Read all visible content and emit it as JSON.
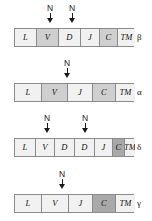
{
  "diagram": {
    "segment_tones": {
      "light": "#f1f1f1",
      "mid": "#cfcfcf",
      "dark": "#a9a9a9"
    },
    "marker_label": "N",
    "rows": [
      {
        "id": "beta",
        "chain_label": "β",
        "top": 4,
        "bar_left": 14,
        "bar_width": 120,
        "segments": [
          {
            "label": "L",
            "tone": "light",
            "width": 22
          },
          {
            "label": "V",
            "tone": "mid",
            "width": 22
          },
          {
            "label": "D",
            "tone": "light",
            "width": 22
          },
          {
            "label": "J",
            "tone": "light",
            "width": 19
          },
          {
            "label": "C",
            "tone": "mid",
            "width": 18
          },
          {
            "label": "TM",
            "tone": "light",
            "width": 17
          }
        ],
        "markers": [
          {
            "label": "N",
            "x": 50
          },
          {
            "label": "N",
            "x": 72
          }
        ]
      },
      {
        "id": "alpha",
        "chain_label": "α",
        "top": 59,
        "bar_left": 14,
        "bar_width": 120,
        "segments": [
          {
            "label": "L",
            "tone": "light",
            "width": 27
          },
          {
            "label": "V",
            "tone": "mid",
            "width": 26
          },
          {
            "label": "J",
            "tone": "light",
            "width": 25
          },
          {
            "label": "C",
            "tone": "mid",
            "width": 23
          },
          {
            "label": "TM",
            "tone": "light",
            "width": 19
          }
        ],
        "markers": [
          {
            "label": "N",
            "x": 67
          }
        ]
      },
      {
        "id": "delta",
        "chain_label": "δ",
        "top": 114,
        "bar_left": 14,
        "bar_width": 120,
        "segments": [
          {
            "label": "L",
            "tone": "light",
            "width": 21
          },
          {
            "label": "V",
            "tone": "light",
            "width": 19
          },
          {
            "label": "D",
            "tone": "light",
            "width": 20
          },
          {
            "label": "D",
            "tone": "light",
            "width": 20
          },
          {
            "label": "J",
            "tone": "light",
            "width": 18
          },
          {
            "label": "C",
            "tone": "dark",
            "width": 12
          },
          {
            "label": "TM",
            "tone": "light",
            "width": 10
          }
        ],
        "markers": [
          {
            "label": "N",
            "x": 47
          },
          {
            "label": "N",
            "x": 85
          }
        ]
      },
      {
        "id": "gamma",
        "chain_label": "γ",
        "top": 170,
        "bar_left": 14,
        "bar_width": 120,
        "segments": [
          {
            "label": "L",
            "tone": "light",
            "width": 27
          },
          {
            "label": "V",
            "tone": "light",
            "width": 27
          },
          {
            "label": "J",
            "tone": "light",
            "width": 24
          },
          {
            "label": "C",
            "tone": "dark",
            "width": 23
          },
          {
            "label": "TM",
            "tone": "light",
            "width": 19
          }
        ],
        "markers": [
          {
            "label": "N",
            "x": 62
          }
        ]
      }
    ]
  }
}
